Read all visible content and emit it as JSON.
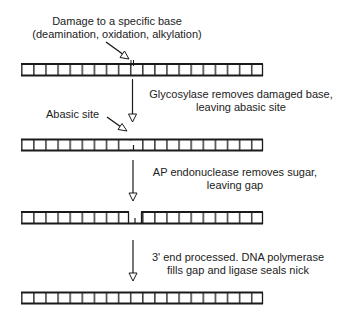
{
  "diagram": {
    "colors": {
      "ink": "#1a1a1a",
      "background": "#ffffff"
    },
    "labels": {
      "damage_line1": "Damage to a specific base",
      "damage_line2": "(deamination, oxidation, alkylation)",
      "step1_line1": "Glycosylase removes damaged base,",
      "step1_line2": "leaving abasic site",
      "abasic": "Abasic site",
      "step2_line1": "AP endonuclease removes sugar,",
      "step2_line2": "leaving gap",
      "step3_line1": "3' end processed. DNA polymerase",
      "step3_line2": "fills gap and ligase seals nick"
    },
    "strands": [
      {
        "name": "damaged-dna",
        "y": 63,
        "state": "damaged base"
      },
      {
        "name": "abasic-dna",
        "y": 138,
        "state": "abasic site"
      },
      {
        "name": "gapped-dna",
        "y": 210,
        "state": "gap"
      },
      {
        "name": "repaired-dna",
        "y": 290,
        "state": "repaired"
      }
    ]
  }
}
